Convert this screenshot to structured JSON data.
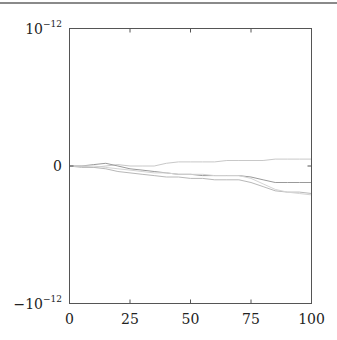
{
  "chart_data": {
    "type": "line",
    "title": "",
    "xlabel": "",
    "ylabel": "",
    "xlim": [
      0,
      100
    ],
    "ylim": [
      -1e-12,
      1e-12
    ],
    "grid": false,
    "legend": null,
    "x_ticks": [
      0,
      25,
      50,
      75,
      100
    ],
    "x_tick_labels": [
      "0",
      "25",
      "50",
      "75",
      "100"
    ],
    "y_ticks": [
      -1e-12,
      0,
      1e-12
    ],
    "y_tick_labels": [
      {
        "base": "−10",
        "exp": "−12"
      },
      {
        "base": "0",
        "exp": ""
      },
      {
        "base": "10",
        "exp": "−12"
      }
    ],
    "x": [
      0,
      5,
      10,
      15,
      20,
      25,
      30,
      35,
      40,
      45,
      50,
      55,
      60,
      65,
      70,
      75,
      80,
      85,
      90,
      95,
      100
    ],
    "series": [
      {
        "name": "series-1",
        "color": "#c8c8c8",
        "values_e12": [
          0,
          0.0,
          -0.01,
          0.0,
          0.01,
          0.0,
          0.0,
          0.0,
          0.02,
          0.03,
          0.03,
          0.03,
          0.03,
          0.04,
          0.04,
          0.04,
          0.04,
          0.05,
          0.05,
          0.05,
          0.05
        ]
      },
      {
        "name": "series-2",
        "color": "#9a9a9a",
        "values_e12": [
          0,
          0.0,
          0.01,
          0.02,
          0.0,
          -0.02,
          -0.03,
          -0.04,
          -0.05,
          -0.06,
          -0.06,
          -0.07,
          -0.07,
          -0.07,
          -0.07,
          -0.08,
          -0.1,
          -0.12,
          -0.12,
          -0.12,
          -0.12
        ]
      },
      {
        "name": "series-3",
        "color": "#b8b8b8",
        "values_e12": [
          0,
          -0.01,
          -0.01,
          -0.02,
          -0.04,
          -0.05,
          -0.06,
          -0.07,
          -0.08,
          -0.08,
          -0.09,
          -0.09,
          -0.1,
          -0.1,
          -0.1,
          -0.12,
          -0.15,
          -0.18,
          -0.19,
          -0.19,
          -0.2
        ]
      },
      {
        "name": "series-4",
        "color": "#d4d4d4",
        "values_e12": [
          0,
          0.0,
          0.0,
          -0.01,
          -0.02,
          -0.03,
          -0.04,
          -0.05,
          -0.05,
          -0.06,
          -0.06,
          -0.06,
          -0.07,
          -0.07,
          -0.07,
          -0.09,
          -0.13,
          -0.17,
          -0.19,
          -0.2,
          -0.21
        ]
      }
    ]
  }
}
